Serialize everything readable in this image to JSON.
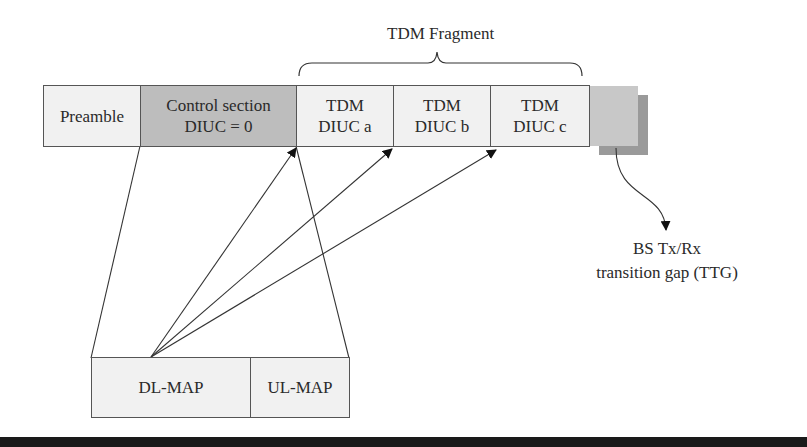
{
  "diagram": {
    "fragment_label": "TDM Fragment",
    "frame": {
      "preamble": "Preamble",
      "control": {
        "line1": "Control section",
        "line2": "DIUC = 0"
      },
      "tdm": [
        {
          "line1": "TDM",
          "line2": "DIUC a"
        },
        {
          "line1": "TDM",
          "line2": "DIUC b"
        },
        {
          "line1": "TDM",
          "line2": "DIUC c"
        }
      ]
    },
    "gap_label": {
      "line1": "BS Tx/Rx",
      "line2": "transition gap (TTG)"
    },
    "maps": {
      "dl": "DL-MAP",
      "ul": "UL-MAP"
    },
    "colors": {
      "light_fill": "#f1f1f1",
      "control_fill": "#bdbdbd",
      "gap_fill_front": "#c8c8c8",
      "gap_fill_back": "#9a9a9a",
      "stroke": "#333333"
    }
  }
}
